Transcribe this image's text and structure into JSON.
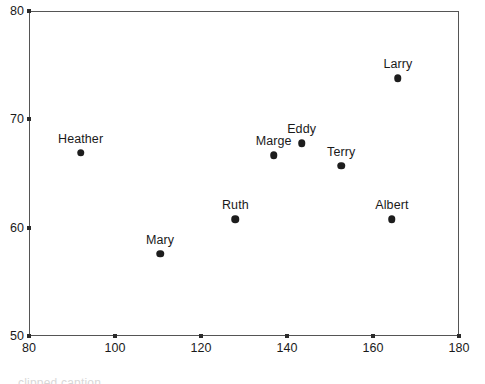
{
  "chart_data": {
    "type": "scatter",
    "title": "",
    "subtitle": "",
    "xlabel": "",
    "ylabel": "",
    "xlim": [
      80,
      180
    ],
    "ylim": [
      50,
      80
    ],
    "xticks": [
      80,
      100,
      120,
      140,
      160,
      180
    ],
    "yticks": [
      50,
      60,
      70,
      80
    ],
    "xtick_labels": [
      "80",
      "100",
      "120",
      "140",
      "160",
      "180"
    ],
    "ytick_labels": [
      "50",
      "60",
      "70",
      "80"
    ],
    "grid": false,
    "legend": false,
    "legend_position": "none",
    "marker_color": "#1d1d1d",
    "frame_color": "#555555",
    "points": [
      {
        "label": "Heather",
        "x": 92,
        "y": 66.9
      },
      {
        "label": "Mary",
        "x": 110.5,
        "y": 57.6
      },
      {
        "label": "Ruth",
        "x": 128,
        "y": 60.8
      },
      {
        "label": "Marge",
        "x": 136.9,
        "y": 66.7
      },
      {
        "label": "Eddy",
        "x": 143.4,
        "y": 67.8
      },
      {
        "label": "Terry",
        "x": 152.6,
        "y": 65.7
      },
      {
        "label": "Albert",
        "x": 164.4,
        "y": 60.8
      },
      {
        "label": "Larry",
        "x": 165.8,
        "y": 73.8
      }
    ]
  },
  "footer": {
    "ghost_text": "clipped caption"
  }
}
